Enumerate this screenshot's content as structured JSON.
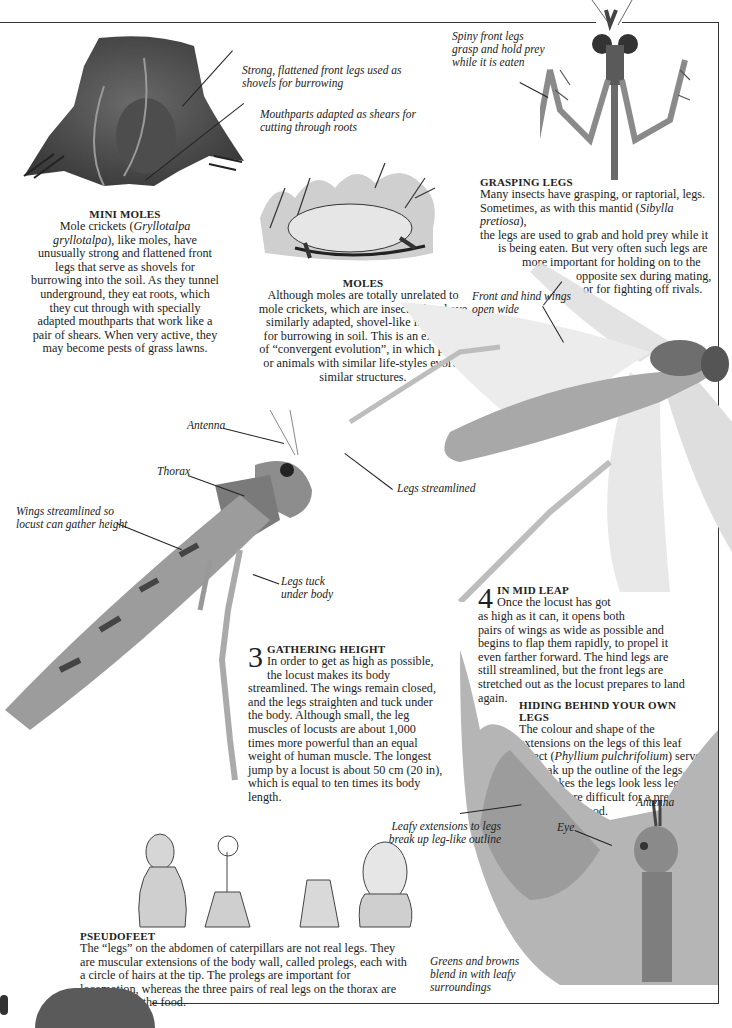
{
  "page": {
    "sections": {
      "mini_moles": {
        "heading": "MINI MOLES",
        "body_pre": "Mole crickets (",
        "species": "Gryllotalpa gryllotalpa",
        "body_post": "), like moles, have unusually strong and flattened front legs that serve as shovels for burrowing into the soil. As they tunnel underground, they eat roots, which they cut through with specially adapted mouthparts that work like a pair of shears. When very active, they may become pests of grass lawns.",
        "captions": [
          "Strong, flattened front legs used as shovels for burrowing",
          "Mouthparts adapted as shears for cutting through roots"
        ]
      },
      "moles": {
        "heading": "MOLES",
        "body": "Although moles are totally unrelated to mole crickets, which are insects, they have similarly adapted, shovel-like front legs for burrowing in soil. This is an example of “convergent evolution”, in which plants or animals with similar life-styles evolve similar structures."
      },
      "grasping_legs": {
        "heading": "GRASPING LEGS",
        "lines": [
          "Many insects have grasping, or raptorial, legs.",
          "Sometimes, as with this mantid (",
          "Sibylla pretiosa",
          "),",
          "the legs are used to grab and hold prey while it",
          "is being eaten. But very often such legs are",
          "more important for holding on to the",
          "opposite sex during mating,",
          "or for fighting off rivals."
        ],
        "caption": "Spiny front legs grasp and hold prey while it is eaten"
      },
      "locust_flight": {
        "captions": {
          "wings": "Front and hind wings open wide",
          "legs": "Legs streamlined"
        }
      },
      "locust_body": {
        "captions": {
          "antenna": "Antenna",
          "thorax": "Thorax",
          "wings": "Wings streamlined so locust can gather height",
          "legs": "Legs tuck under body"
        }
      },
      "gathering_height": {
        "number": "3",
        "heading": "GATHERING HEIGHT",
        "body": "In order to get as high as possible, the locust makes its body streamlined. The wings remain closed, and the legs straighten and tuck under the body. Although small, the leg muscles of locusts are about 1,000 times more powerful than an equal weight of human muscle. The longest jump by a locust is about 50 cm (20 in), which is equal to ten times its body length."
      },
      "mid_leap": {
        "number": "4",
        "heading": "IN MID LEAP",
        "line1": "Once the locust has got",
        "line2": "as high as it can, it opens both",
        "rest": "pairs of wings as wide as possible and begins to flap them rapidly, to propel it even farther forward. The hind legs are still streamlined, but the front legs are stretched out as the locust prepares to land again."
      },
      "hiding": {
        "heading": "HIDING BEHIND YOUR OWN LEGS",
        "body_pre": "The colour and shape of the extensions on the legs of this leaf insect (",
        "species": "Phyllium pulchrifolium",
        "body_post": ") serve to break up the outline of the legs. This makes the legs look less leg-like and are more difficult for a predator to recognize as food.",
        "captions": {
          "leafy": "Leafy extensions to legs break up leg-like outline",
          "antenna": "Antenna",
          "eye": "Eye",
          "greens": "Greens and browns blend in with leafy surroundings"
        }
      },
      "pseudofeet": {
        "heading": "PSEUDOFEET",
        "body": "The “legs” on the abdomen of caterpillars are not real legs. They are muscular extensions of the body wall, called prolegs, each with a circle of hairs at the tip. The prolegs are important for locomotion, whereas the three pairs of real legs on the thorax are used to hold the food."
      }
    },
    "colors": {
      "text": "#1e1e1e",
      "frame": "#333333",
      "paper": "#ffffff"
    }
  }
}
